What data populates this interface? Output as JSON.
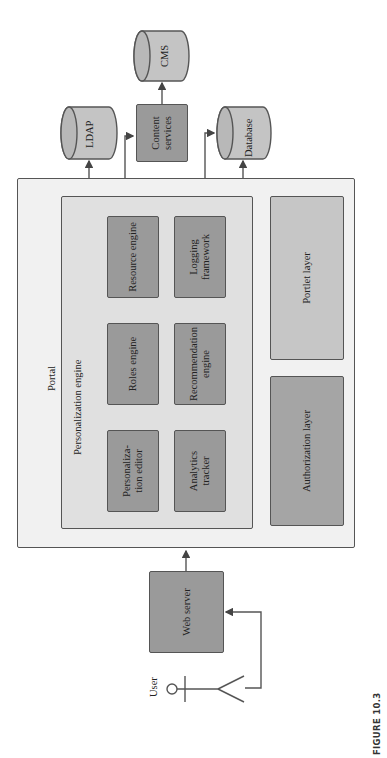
{
  "figure": {
    "caption": "FIGURE 10.3",
    "orientation": "rotated 90° counter-clockwise"
  },
  "actor": {
    "label": "User",
    "icon": "stick-figure-icon"
  },
  "web_server": {
    "label": "Web server"
  },
  "portal": {
    "label": "Portal",
    "personalization_engine": {
      "label": "Personalization engine",
      "components": {
        "resource_engine": "Resource engine",
        "logging_framework": "Logging framework",
        "roles_engine": "Roles engine",
        "recommendation_engine": "Recommendation engine",
        "personalization_editor": "Personaliza-\ntion editor",
        "analytics_tracker": "Analytics tracker"
      }
    },
    "layers": {
      "portlet": "Portlet layer",
      "authorization": "Authorization layer"
    }
  },
  "external": {
    "ldap": "LDAP",
    "content_services": "Content services",
    "database": "Database",
    "cms": "CMS"
  },
  "connections": [
    {
      "from": "User",
      "to": "Web server"
    },
    {
      "from": "Web server",
      "to": "Portal"
    },
    {
      "from": "Personalization editor",
      "to": "Roles engine"
    },
    {
      "from": "Roles engine",
      "to": "Resource engine"
    },
    {
      "from": "Analytics tracker",
      "to": "Recommendation engine"
    },
    {
      "from": "Recommendation engine",
      "to": "Logging framework",
      "bidirectional": true
    },
    {
      "from": "Resource engine",
      "to": "LDAP"
    },
    {
      "from": "Resource engine",
      "to": "Content services"
    },
    {
      "from": "Resource engine",
      "to": "Database"
    },
    {
      "from": "Logging framework",
      "to": "Database"
    },
    {
      "from": "Content services",
      "to": "CMS"
    }
  ],
  "colors": {
    "portal_bg": "#f1f1f1",
    "engine_bg": "#e0e0e0",
    "component_bg": "#9a9a9a",
    "portlet_bg": "#c6c6c6",
    "cylinder_bg": "#c4c4c4",
    "stroke": "#555555"
  }
}
